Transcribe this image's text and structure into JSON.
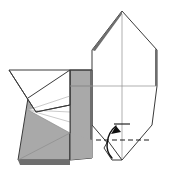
{
  "figure": {
    "type": "origami-diagram",
    "background_color": "#ffffff",
    "canvas": {
      "width": 179,
      "height": 187
    }
  },
  "colors": {
    "paper_front": "#ffffff",
    "paper_back": "#a9a9a9",
    "paper_edge": "#6e6e6e",
    "outline": "#3a3a3a",
    "crease": "#8d8d8d",
    "crease_light": "#b4b4b4",
    "fold_line": "#1d1d1d",
    "arrow": "#111111"
  },
  "shapes": {
    "right_hexagon": {
      "name": "right-main-body",
      "fill": "paper_front",
      "points": "122,11 157,50 157,86 152,125 122,160 92,125 92,50"
    },
    "right_hexagon_highlight": {
      "name": "right-apex-fold-highlight",
      "points": "122,11 92,50 95,51 122,14"
    },
    "right_edge_sliver": {
      "name": "right-edge-thickness",
      "points": "155,49 157,50 157,86 155,86"
    },
    "left_upper_flap": {
      "name": "left-upper-flap",
      "fill": "paper_front",
      "points": "9,70 70,70 70,105 36,112"
    },
    "left_body": {
      "name": "left-lower-body",
      "fill": "paper_back",
      "points": "28,98 70,70 70,160 18,160"
    },
    "left_panel_front": {
      "name": "left-white-panel",
      "fill": "paper_front",
      "points": "28,110 70,96 70,133"
    },
    "left_bottom_edge": {
      "name": "left-bottom-paper-edge",
      "fill": "paper_edge",
      "points": "18,160 70,160 70,165 20,165"
    },
    "left_inner_column": {
      "name": "left-inner-column",
      "fill": "paper_back",
      "points": "70,70 92,70 92,158 70,160"
    },
    "left_column_edge": {
      "name": "left-column-paper-edge",
      "fill": "paper_edge",
      "points": "90,70 92,70 92,158 90,158"
    },
    "lower_shaded_wedge": {
      "name": "lower-shaded-wedge",
      "fill": "paper_back",
      "points": "70,133 92,140 92,158 70,160"
    },
    "small_bottom_tab": {
      "name": "bottom-small-tab",
      "fill": "paper_front",
      "points": "108,141 122,160 112,160 104,148"
    }
  },
  "creases": [
    {
      "name": "hexagon-center-vertical",
      "d": "M122,14 L122,158"
    },
    {
      "name": "hexagon-horizontal-mid",
      "d": "M70,86 L157,86"
    },
    {
      "name": "left-fan-line-top",
      "d": "M28,110 L70,96"
    },
    {
      "name": "left-fan-line-mid",
      "d": "M28,110 L70,112"
    },
    {
      "name": "left-fan-line-low",
      "d": "M28,110 L70,122"
    },
    {
      "name": "left-fan-line-bottom",
      "d": "M28,110 L70,133"
    },
    {
      "name": "left-flap-diagonal",
      "d": "M9,70 L36,112"
    },
    {
      "name": "left-flap-lower-edge",
      "d": "M36,112 L70,105"
    },
    {
      "name": "left-vertical-divider",
      "d": "M70,70 L70,160"
    },
    {
      "name": "left-body-diagonal",
      "d": "M28,98 L70,70"
    },
    {
      "name": "left-lower-diagonal",
      "d": "M18,160 L70,133"
    },
    {
      "name": "column-top-edge",
      "d": "M70,70 L92,70"
    },
    {
      "name": "column-mid-tick",
      "d": "M70,86 L92,86"
    }
  ],
  "fold_indicator": {
    "name": "valley-fold-indicator",
    "dashed_line": {
      "label": "fold-line",
      "d": "M96,140 L150,140"
    },
    "arrow": {
      "label": "fold-up-arrow",
      "path": "M112,158 C104,150 106,134 116,126",
      "head_points": "116,126 111,134 121,132",
      "direction": "up"
    },
    "tick_mark": {
      "label": "fold-reference-tick",
      "d": "M114,124 L130,124"
    }
  }
}
